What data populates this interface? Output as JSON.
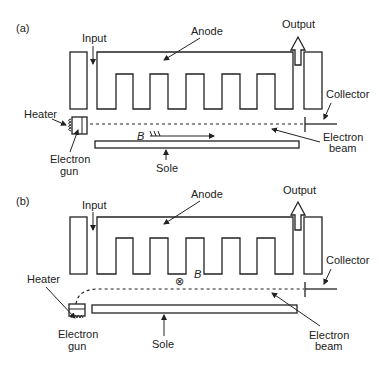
{
  "figure": {
    "panels": [
      {
        "id": "a",
        "tag": "(a)",
        "labels": {
          "input": "Input",
          "anode": "Anode",
          "output": "Output",
          "collector": "Collector",
          "heater": "Heater",
          "electron_gun_line1": "Electron",
          "electron_gun_line2": "gun",
          "electron_beam_line1": "Electron",
          "electron_beam_line2": "beam",
          "sole": "Sole",
          "magnetic_field": "B"
        },
        "beam_path": "straight",
        "field_direction": "along-beam"
      },
      {
        "id": "b",
        "tag": "(b)",
        "labels": {
          "input": "Input",
          "anode": "Anode",
          "output": "Output",
          "collector": "Collector",
          "heater": "Heater",
          "electron_gun_line1": "Electron",
          "electron_gun_line2": "gun",
          "electron_beam_line1": "Electron",
          "electron_beam_line2": "beam",
          "sole": "Sole",
          "magnetic_field": "B",
          "field_symbol": "⊗"
        },
        "beam_path": "curved-from-below",
        "field_direction": "into-page"
      }
    ]
  }
}
